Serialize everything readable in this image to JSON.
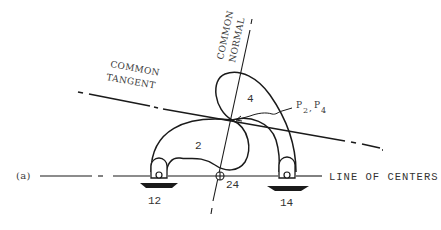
{
  "figure": {
    "panel_label": "(a)",
    "labels": {
      "common_tangent_line1": "COMMON",
      "common_tangent_line2": "TANGENT",
      "common_normal_line1": "COMMON",
      "common_normal_line2": "NORMAL",
      "line_of_centers": "LINE OF CENTERS",
      "contact_point_p": "P",
      "contact_point_sub1": "2",
      "contact_point_sep": ",",
      "contact_point_p2": "P",
      "contact_point_sub2": "4"
    },
    "links": {
      "link_2": "2",
      "link_4": "4"
    },
    "pivots": {
      "ground_left": "12",
      "ground_right": "14",
      "instant_center": "24"
    },
    "colors": {
      "ink": "#1a1a1a",
      "text": "#3a3a3a",
      "background": "#ffffff"
    }
  }
}
